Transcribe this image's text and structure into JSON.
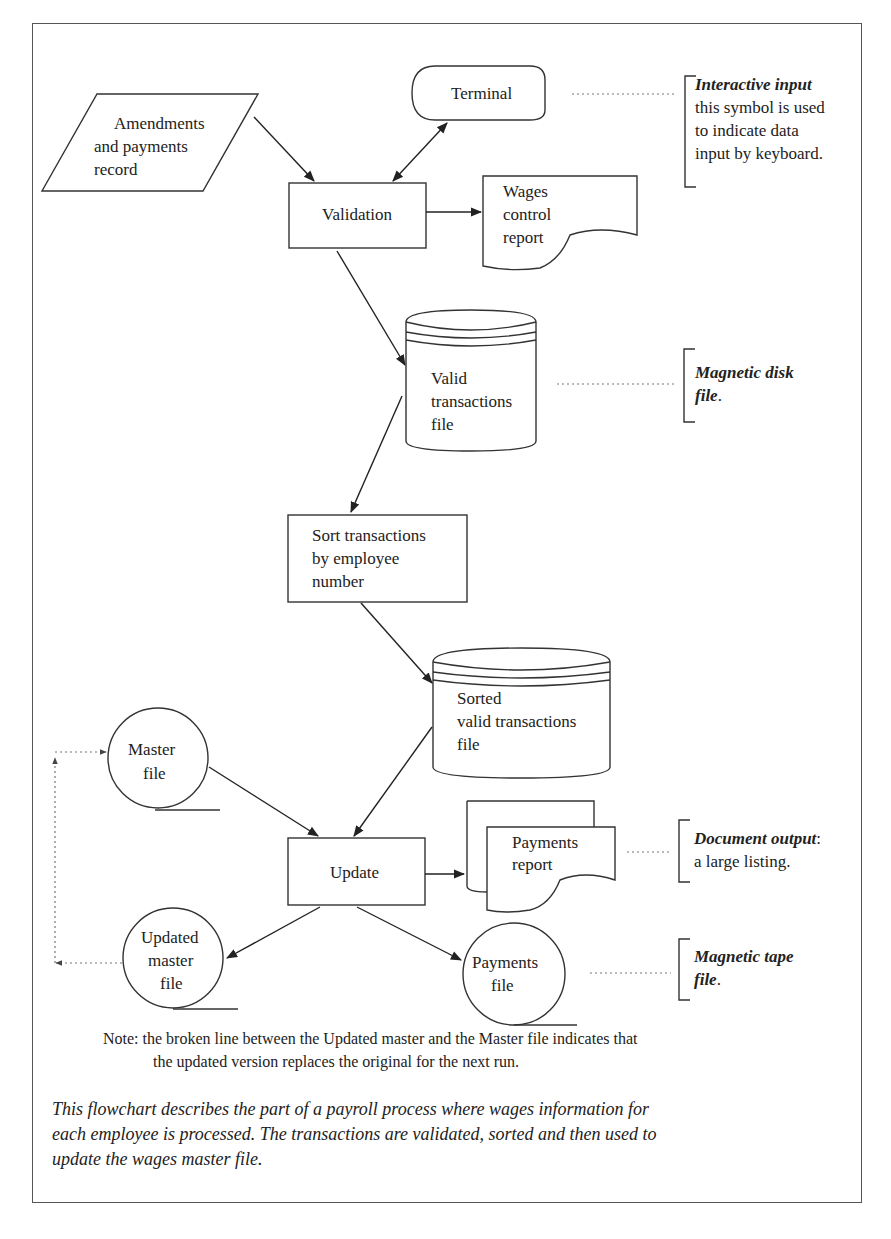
{
  "nodes": {
    "amendments": {
      "shape": "parallelogram",
      "lines": [
        "Amendments",
        "and payments",
        "record"
      ]
    },
    "terminal": {
      "shape": "terminal",
      "label": "Terminal"
    },
    "validation": {
      "shape": "process",
      "label": "Validation"
    },
    "wages_report": {
      "shape": "document",
      "lines": [
        "Wages",
        "control",
        "report"
      ]
    },
    "valid_transactions": {
      "shape": "magnetic-disk",
      "lines": [
        "Valid",
        "transactions",
        "file"
      ]
    },
    "sort": {
      "shape": "process",
      "lines": [
        "Sort transactions",
        "by employee",
        "number"
      ]
    },
    "sorted_transactions": {
      "shape": "magnetic-disk",
      "lines": [
        "Sorted",
        "valid transactions",
        "file"
      ]
    },
    "master_file": {
      "shape": "magnetic-tape",
      "lines": [
        "Master",
        "file"
      ]
    },
    "update": {
      "shape": "process",
      "label": "Update"
    },
    "payments_report": {
      "shape": "multi-document",
      "lines": [
        "Payments",
        "report"
      ]
    },
    "updated_master": {
      "shape": "magnetic-tape",
      "lines": [
        "Updated",
        "master",
        "file"
      ]
    },
    "payments_file": {
      "shape": "magnetic-tape",
      "lines": [
        "Payments",
        "file"
      ]
    }
  },
  "edges": [
    {
      "from": "amendments",
      "to": "validation",
      "style": "solid"
    },
    {
      "from": "terminal",
      "to": "validation",
      "style": "solid",
      "bidirectional": true
    },
    {
      "from": "validation",
      "to": "wages_report",
      "style": "solid"
    },
    {
      "from": "validation",
      "to": "valid_transactions",
      "style": "solid"
    },
    {
      "from": "valid_transactions",
      "to": "sort",
      "style": "solid"
    },
    {
      "from": "sort",
      "to": "sorted_transactions",
      "style": "solid"
    },
    {
      "from": "sorted_transactions",
      "to": "update",
      "style": "solid"
    },
    {
      "from": "master_file",
      "to": "update",
      "style": "solid"
    },
    {
      "from": "update",
      "to": "payments_report",
      "style": "solid"
    },
    {
      "from": "update",
      "to": "updated_master",
      "style": "solid"
    },
    {
      "from": "update",
      "to": "payments_file",
      "style": "solid"
    },
    {
      "from": "updated_master",
      "to": "master_file",
      "style": "dotted"
    }
  ],
  "annotations": {
    "interactive": {
      "title": "Interactive input",
      "lines": [
        "this symbol is used",
        "to indicate data",
        "input by keyboard."
      ]
    },
    "disk": {
      "title": "Magnetic disk",
      "title2": "file",
      "suffix": "."
    },
    "document": {
      "title": "Document output",
      "suffix": ":",
      "line": "a large listing."
    },
    "tape": {
      "title": "Magnetic tape",
      "title2": "file",
      "suffix": "."
    }
  },
  "note": {
    "line1": "Note: the broken line between the Updated master and the Master file indicates that",
    "line2": "the updated version replaces the original for the next run."
  },
  "caption": {
    "line1": "This flowchart describes the part of a payroll process where wages information for",
    "line2": "each employee is processed. The transactions are validated, sorted and then used to",
    "line3": "update the wages master file."
  }
}
